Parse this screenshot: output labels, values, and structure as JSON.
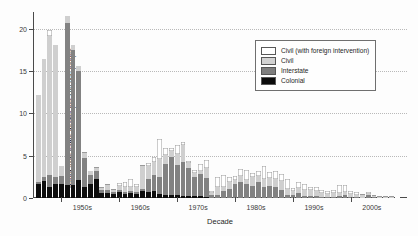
{
  "chart_data": {
    "type": "bar",
    "title": "",
    "xlabel": "Decade",
    "ylabel": "World-wide battle-deaths per 100,000 people",
    "ylim": [
      0,
      22
    ],
    "yticks": [
      0,
      5,
      10,
      15,
      20
    ],
    "ytick_labels": [
      "0",
      "5",
      "10",
      "15",
      "20"
    ],
    "grid": "horizontal-dotted",
    "stacked": true,
    "legend_position": "upper-right",
    "xtick_labels": [
      "1940s",
      "1950s",
      "1960s",
      "1970s",
      "1980s",
      "1990s",
      "2000s"
    ],
    "xticks": [
      1940,
      1950,
      1960,
      1970,
      1980,
      1990,
      2000
    ],
    "x": [
      1946,
      1947,
      1948,
      1949,
      1950,
      1951,
      1952,
      1953,
      1954,
      1955,
      1956,
      1957,
      1958,
      1959,
      1960,
      1961,
      1962,
      1963,
      1964,
      1965,
      1966,
      1967,
      1968,
      1969,
      1970,
      1971,
      1972,
      1973,
      1974,
      1975,
      1976,
      1977,
      1978,
      1979,
      1980,
      1981,
      1982,
      1983,
      1984,
      1985,
      1986,
      1987,
      1988,
      1989,
      1990,
      1991,
      1992,
      1993,
      1994,
      1995,
      1996,
      1997,
      1998,
      1999,
      2000,
      2001,
      2002,
      2003,
      2004,
      2005,
      2006,
      2007,
      2008
    ],
    "series": [
      {
        "name": "Colonial",
        "color": "#0d0d0d",
        "values": [
          1.7,
          2.0,
          1.3,
          1.6,
          1.6,
          1.5,
          1.5,
          2.1,
          1.3,
          1.6,
          2.2,
          0.6,
          0.6,
          0.5,
          0.7,
          0.5,
          0.6,
          0.5,
          0.8,
          0.7,
          0.8,
          0.5,
          0.4,
          0.3,
          0.3,
          0.25,
          0.2,
          0.2,
          0.2,
          0.15,
          0.05,
          0.05,
          0.05,
          0.05,
          0.05,
          0.05,
          0.05,
          0.05,
          0.05,
          0.05,
          0.05,
          0.05,
          0.05,
          0.05,
          0,
          0,
          0,
          0,
          0,
          0,
          0,
          0,
          0,
          0,
          0,
          0,
          0,
          0,
          0,
          0,
          0,
          0,
          0
        ]
      },
      {
        "name": "Interstate",
        "color": "#828282",
        "values": [
          0.2,
          0.5,
          1.4,
          0.9,
          1.0,
          19.2,
          16.0,
          12.9,
          3.4,
          1.1,
          1.0,
          0.3,
          0.3,
          0.2,
          0.3,
          0.2,
          0.2,
          0.2,
          0.25,
          1.6,
          1.9,
          2.0,
          3.6,
          4.6,
          3.6,
          4.0,
          3.4,
          2.3,
          2.6,
          2.2,
          0.3,
          0.3,
          0.8,
          1.0,
          1.6,
          1.9,
          1.6,
          1.4,
          1.9,
          1.3,
          1.4,
          1.3,
          0.9,
          0.3,
          0.3,
          0.6,
          0.2,
          0.2,
          0.2,
          0.15,
          0.1,
          0.1,
          0.25,
          0.3,
          0.15,
          0.1,
          0.05,
          0.3,
          0.1,
          0.05,
          0.05,
          0.05,
          0.05
        ]
      },
      {
        "name": "Civil",
        "color": "#cfcfcf",
        "values": [
          10.3,
          14.0,
          16.5,
          15.6,
          1.2,
          0.8,
          0.6,
          0.6,
          0.6,
          0.5,
          0.4,
          0.3,
          0.6,
          0.3,
          0.4,
          0.6,
          0.5,
          0.6,
          2.7,
          1.5,
          1.6,
          2.1,
          1.1,
          0.7,
          1.3,
          2.0,
          0.5,
          0.5,
          0.4,
          1.2,
          0.2,
          1.0,
          0.5,
          0.9,
          0.5,
          0.7,
          0.5,
          1.0,
          0.6,
          0.9,
          0.9,
          0.9,
          1.1,
          0.7,
          0.5,
          0.6,
          0.8,
          0.7,
          0.6,
          0.5,
          0.4,
          0.5,
          0.4,
          0.4,
          0.3,
          0.3,
          0.25,
          0.2,
          0.15,
          0.1,
          0.1,
          0.08,
          0.05
        ]
      },
      {
        "name": "Civil (with foreign intervention)",
        "color": "#ffffff",
        "values": [
          0,
          0,
          0.7,
          0,
          0,
          0,
          0,
          0,
          0.1,
          0,
          0.1,
          0.1,
          0.2,
          0.1,
          0.4,
          0.6,
          0.9,
          0.4,
          0.2,
          0.3,
          0.5,
          2.4,
          0.8,
          0.3,
          1.1,
          0.4,
          0.3,
          0.3,
          0.8,
          1.0,
          0.3,
          1.1,
          1.4,
          0.5,
          0.4,
          0.8,
          1.2,
          0.5,
          0.7,
          1.5,
          0.7,
          0.9,
          0.8,
          1.2,
          0.4,
          0.7,
          0.6,
          0.4,
          0.5,
          0.3,
          0.3,
          0.4,
          0.9,
          0.8,
          0.4,
          0.3,
          0.2,
          0.25,
          0.15,
          0.1,
          0.1,
          0.05,
          0.05
        ]
      }
    ]
  },
  "legend": {
    "items": [
      {
        "label": "Civil (with foreign intervention)",
        "swatch": "civilforeign"
      },
      {
        "label": "Civil",
        "swatch": "civil"
      },
      {
        "label": "Interstate",
        "swatch": "interstate"
      },
      {
        "label": "Colonial",
        "swatch": "colonial"
      }
    ]
  }
}
